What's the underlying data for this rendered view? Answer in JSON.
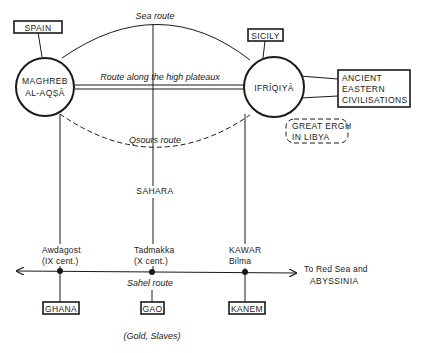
{
  "diagram": {
    "hubs": {
      "maghreb": {
        "line1": "MAGHREB",
        "line2": "AL-AQṢĀ"
      },
      "ifriqiya": {
        "label": "IFRĪQIYĀ"
      }
    },
    "boxes": {
      "spain": "SPAIN",
      "sicily": "SICILY",
      "ancient_eastern": {
        "line1": "ANCIENT",
        "line2": "EASTERN",
        "line3": "CIVILISATIONS"
      },
      "great_ergh": {
        "line1": "GREAT ERGH",
        "line2": "IN LIBYA"
      },
      "ghana": "GHANA",
      "gao": "GAO",
      "kanem": "KANEM"
    },
    "routes": {
      "sea": "Sea route",
      "high_plateaux": "Route along the high plateaux",
      "qsours": "Qsours route",
      "sahel": "Sahel route"
    },
    "regions": {
      "sahara": "SAHARA"
    },
    "stations": {
      "awdagost": {
        "name": "Awdagost",
        "note": "(IX cent.)"
      },
      "tadmakka": {
        "name": "Tadmakka",
        "note": "(X cent.)"
      },
      "kawar": {
        "name": "KAWAR",
        "note": "Bilma"
      }
    },
    "destination": {
      "line1": "To Red Sea and",
      "line2": "ABYSSINIA"
    },
    "goods": "(Gold, Slaves)"
  }
}
